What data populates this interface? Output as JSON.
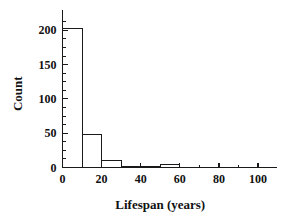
{
  "chart_data": {
    "type": "bar",
    "title": "",
    "subtitle": "",
    "xlabel": "Lifespan (years)",
    "ylabel": "Count",
    "categories": [
      "0-10",
      "10-20",
      "20-30",
      "30-40",
      "40-50",
      "50-60",
      "60-70",
      "70-80",
      "80-90",
      "90-100"
    ],
    "bin_edges": [
      0,
      10,
      20,
      30,
      40,
      50,
      60,
      70,
      80,
      90,
      100
    ],
    "bin_width": 10,
    "values": [
      202,
      48,
      10,
      2,
      2,
      5,
      0,
      0,
      0,
      0
    ],
    "xlim": [
      0,
      108
    ],
    "ylim": [
      0,
      215
    ],
    "x_tick_labels": [
      "0",
      "20",
      "40",
      "60",
      "80",
      "100"
    ],
    "x_tick_values": [
      0,
      20,
      40,
      60,
      80,
      100
    ],
    "x_minor_step": 10,
    "y_tick_labels": [
      "0",
      "50",
      "100",
      "150",
      "200"
    ],
    "y_tick_values": [
      0,
      50,
      100,
      150,
      200
    ],
    "y_minor_step": 12.5,
    "grid": false,
    "legend": null,
    "bar_fill": "#ffffff",
    "bar_edge": "#1a1a1a",
    "axis_color": "#1a1a1a",
    "background": "#ffffff",
    "annotations": []
  },
  "figure": {
    "name": "lifespan-histogram"
  }
}
